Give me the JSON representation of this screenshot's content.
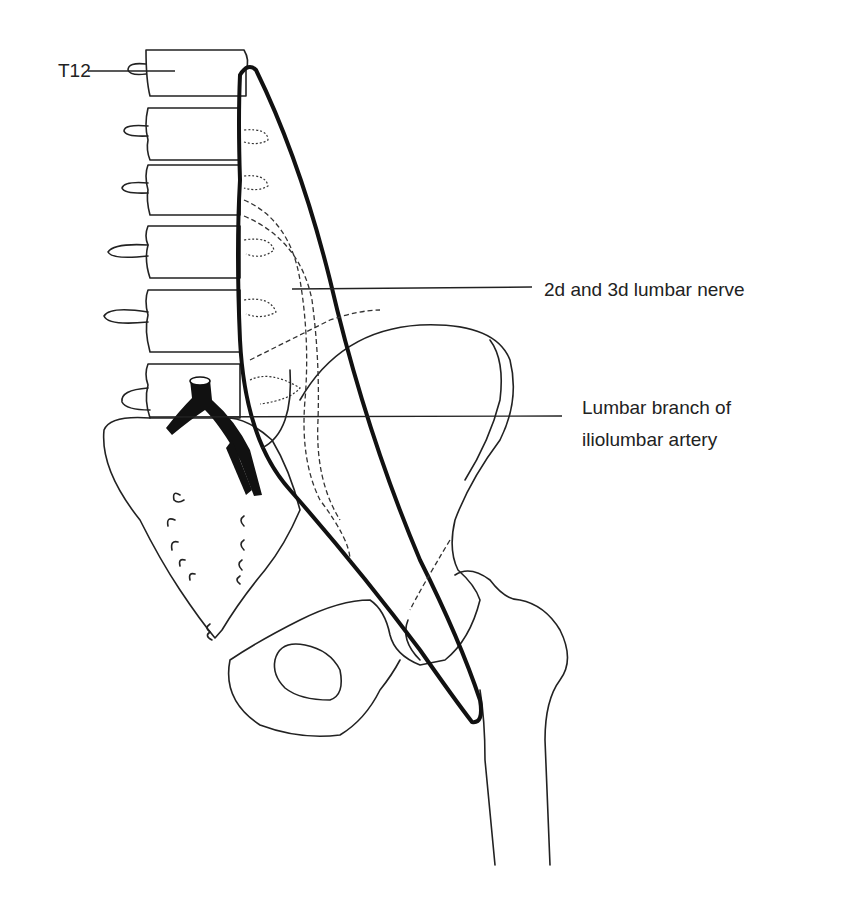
{
  "figure": {
    "labels": {
      "t12": "T12",
      "nerve": "2d and 3d lumbar nerve",
      "artery_line1": "Lumbar branch of",
      "artery_line2": "iliolumbar artery"
    },
    "colors": {
      "ink": "#222222",
      "background": "#ffffff"
    }
  }
}
